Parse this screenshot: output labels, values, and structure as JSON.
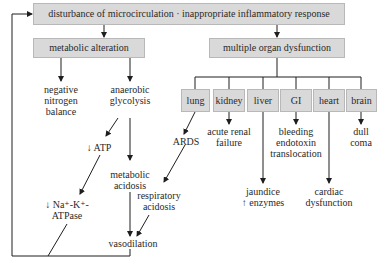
{
  "diagram": {
    "top": {
      "label": "disturbance of microcirculation · inappropriate inflammatory response"
    },
    "left_branch": {
      "label": "metabolic alteration",
      "nodes": {
        "negative_nitrogen": [
          "negative",
          "nitrogen",
          "balance"
        ],
        "anaerobic": [
          "anaerobic",
          "glycolysis"
        ],
        "atp": [
          "↓ ATP"
        ],
        "nak": [
          "↓ Na⁺-K⁺-",
          "ATPase"
        ],
        "metabolic_acidosis": [
          "metabolic",
          "acidosis"
        ],
        "respiratory_acidosis": [
          "respiratory",
          "acidosis"
        ],
        "vasodilation": [
          "vasodilation"
        ]
      }
    },
    "right_branch": {
      "label": "multiple organ dysfunction",
      "organs": [
        {
          "name": "lung",
          "effect": [
            "ARDS"
          ]
        },
        {
          "name": "kidney",
          "effect": [
            "acute renal",
            "failure"
          ]
        },
        {
          "name": "liver",
          "effect": [
            "jaundice",
            "↑ enzymes"
          ]
        },
        {
          "name": "GI",
          "effect": [
            "bleeding",
            "endotoxin",
            "translocation"
          ]
        },
        {
          "name": "heart",
          "effect": [
            "cardiac",
            "dysfunction"
          ]
        },
        {
          "name": "brain",
          "effect": [
            "dull",
            "coma"
          ]
        }
      ]
    },
    "colors": {
      "box_fill": "#d9d9d9",
      "box_border": "#b8b8b8",
      "line": "#1e1e1e"
    }
  }
}
